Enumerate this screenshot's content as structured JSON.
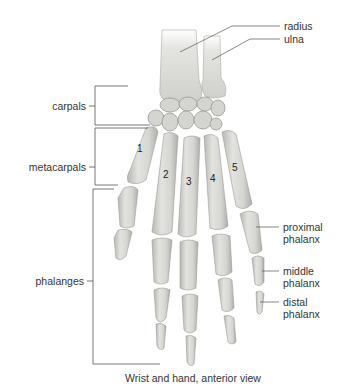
{
  "figure": {
    "title": "Wrist and hand, anterior view",
    "colors": {
      "bone_fill": "#d9d9d6",
      "bone_shade": "#b4b4b0",
      "bone_outline": "#9a9a96",
      "leader_line": "#555555",
      "label_text": "#333333"
    }
  },
  "labels": {
    "right": [
      {
        "id": "radius",
        "text": "radius"
      },
      {
        "id": "ulna",
        "text": "ulna"
      },
      {
        "id": "proximal_phalanx",
        "line1": "proximal",
        "line2": "phalanx"
      },
      {
        "id": "middle_phalanx",
        "line1": "middle",
        "line2": "phalanx"
      },
      {
        "id": "distal_phalanx",
        "line1": "distal",
        "line2": "phalanx"
      }
    ],
    "left": [
      {
        "id": "carpals",
        "text": "carpals"
      },
      {
        "id": "metacarpals",
        "text": "metacarpals"
      },
      {
        "id": "phalanges",
        "text": "phalanges"
      }
    ]
  },
  "digit_numbers": [
    "1",
    "2",
    "3",
    "4",
    "5"
  ]
}
